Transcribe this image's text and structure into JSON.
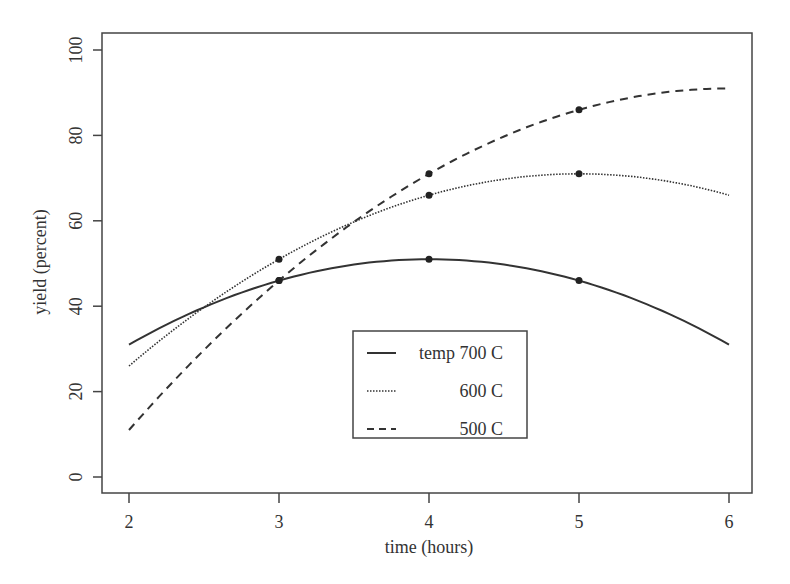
{
  "chart_data": {
    "type": "line",
    "title": "",
    "xlabel": "time (hours)",
    "ylabel": "yield (percent)",
    "xlim": [
      1.85,
      6.15
    ],
    "ylim": [
      -4,
      104
    ],
    "x_ticks": [
      2,
      3,
      4,
      5,
      6
    ],
    "y_ticks": [
      0,
      20,
      40,
      60,
      80,
      100
    ],
    "grid": false,
    "legend_position": "center-bottom (inside plot)",
    "x": [
      2,
      3,
      4,
      5,
      6
    ],
    "series": [
      {
        "name": "temp 700 C",
        "legend_label": "temp 700 C",
        "line_style": "solid",
        "values": [
          31,
          46,
          51,
          46,
          31
        ],
        "markers_at": [
          3,
          4,
          5
        ]
      },
      {
        "name": "600 C",
        "legend_label": "600 C",
        "line_style": "dotted",
        "values": [
          26,
          51,
          66,
          71,
          66
        ],
        "markers_at": [
          3,
          4,
          5
        ]
      },
      {
        "name": "500 C",
        "legend_label": "500 C",
        "line_style": "dashed",
        "values": [
          11,
          46,
          71,
          86,
          91
        ],
        "markers_at": [
          3,
          4,
          5
        ]
      }
    ]
  },
  "colors": {
    "ink": "#333333",
    "background": "#ffffff"
  }
}
